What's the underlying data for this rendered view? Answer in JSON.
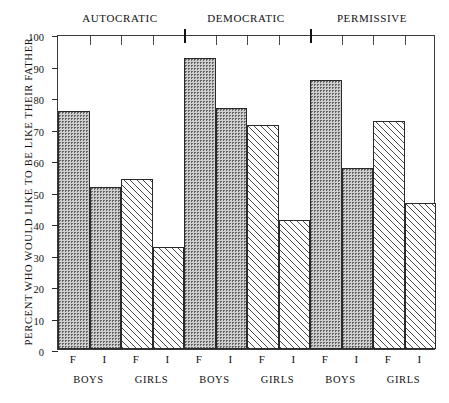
{
  "chart_data": {
    "type": "bar",
    "title": "",
    "xlabel": "",
    "ylabel": "PERCENT WHO WOULD LIKE TO BE LIKE THEIR FATHER",
    "ylim": [
      0,
      100
    ],
    "yticks": [
      0,
      10,
      20,
      30,
      40,
      50,
      60,
      70,
      80,
      90,
      100
    ],
    "ytick_labels": [
      "0",
      "10",
      "20",
      "30",
      "40",
      "50",
      "60",
      "70",
      "80",
      "90",
      "100"
    ],
    "grid": false,
    "legend": "none",
    "group_headings": [
      "AUTOCRATIC",
      "DEMOCRATIC",
      "PERMISSIVE"
    ],
    "pair_labels": [
      "BOYS",
      "GIRLS",
      "BOYS",
      "GIRLS",
      "BOYS",
      "GIRLS"
    ],
    "categories": [
      "F",
      "I",
      "F",
      "I",
      "F",
      "I",
      "F",
      "I",
      "F",
      "I",
      "F",
      "I"
    ],
    "values": [
      75.5,
      51.5,
      54.0,
      32.5,
      92.5,
      76.5,
      71.0,
      41.0,
      85.5,
      57.5,
      72.5,
      46.5
    ],
    "fills": [
      "dots",
      "dots",
      "hatch",
      "hatch",
      "dots",
      "dots",
      "hatch",
      "hatch",
      "dots",
      "dots",
      "hatch",
      "hatch"
    ],
    "bars": [
      {
        "group": "AUTOCRATIC",
        "pair": "BOYS",
        "category": "F",
        "value": 75.5,
        "fill": "dots"
      },
      {
        "group": "AUTOCRATIC",
        "pair": "BOYS",
        "category": "I",
        "value": 51.5,
        "fill": "dots"
      },
      {
        "group": "AUTOCRATIC",
        "pair": "GIRLS",
        "category": "F",
        "value": 54.0,
        "fill": "hatch"
      },
      {
        "group": "AUTOCRATIC",
        "pair": "GIRLS",
        "category": "I",
        "value": 32.5,
        "fill": "hatch"
      },
      {
        "group": "DEMOCRATIC",
        "pair": "BOYS",
        "category": "F",
        "value": 92.5,
        "fill": "dots"
      },
      {
        "group": "DEMOCRATIC",
        "pair": "BOYS",
        "category": "I",
        "value": 76.5,
        "fill": "dots"
      },
      {
        "group": "DEMOCRATIC",
        "pair": "GIRLS",
        "category": "F",
        "value": 71.0,
        "fill": "hatch"
      },
      {
        "group": "DEMOCRATIC",
        "pair": "GIRLS",
        "category": "I",
        "value": 41.0,
        "fill": "hatch"
      },
      {
        "group": "PERMISSIVE",
        "pair": "BOYS",
        "category": "F",
        "value": 85.5,
        "fill": "dots"
      },
      {
        "group": "PERMISSIVE",
        "pair": "BOYS",
        "category": "I",
        "value": 57.5,
        "fill": "dots"
      },
      {
        "group": "PERMISSIVE",
        "pair": "GIRLS",
        "category": "F",
        "value": 72.5,
        "fill": "hatch"
      },
      {
        "group": "PERMISSIVE",
        "pair": "GIRLS",
        "category": "I",
        "value": 46.5,
        "fill": "hatch"
      }
    ]
  }
}
